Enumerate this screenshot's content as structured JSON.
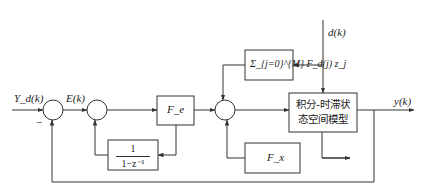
{
  "diagram": {
    "type": "control block diagram",
    "colors": {
      "line": "#333333",
      "background": "#ffffff"
    },
    "signals": {
      "reference": "Y_d(k)",
      "error": "E(k)",
      "disturbance": "d(k)",
      "output": "y(k)",
      "minus_sign": "−"
    },
    "blocks": {
      "controller": "F_e",
      "integrator": {
        "numerator": "1",
        "denominator": "1−z⁻¹"
      },
      "preview": "Σ_{j=0}^{M} F_d(j) z_j",
      "plant_line1": "积分-时滞状",
      "plant_line2": "态空间模型",
      "state_feedback": "F_x"
    },
    "summing_junctions": 3
  }
}
